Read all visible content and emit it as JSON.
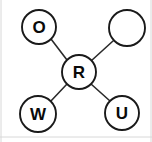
{
  "diagram": {
    "type": "node-link-diagram",
    "canvas": {
      "width": 152,
      "height": 142,
      "background": "#ffffff"
    },
    "style": {
      "node_fill": "#ffffff",
      "node_stroke": "#1a1a1a",
      "node_stroke_width": 1.9,
      "edge_stroke": "#2b2b2b",
      "edge_stroke_width": 1.6,
      "label_color": "#0a0a0a",
      "frame_color": "#d8d8d8"
    },
    "nodes": [
      {
        "id": "top-left",
        "label": "O",
        "cx": 39,
        "cy": 27,
        "r": 17,
        "empty": false
      },
      {
        "id": "top-right",
        "label": "",
        "cx": 127,
        "cy": 28,
        "r": 18,
        "empty": true
      },
      {
        "id": "center",
        "label": "R",
        "cx": 79,
        "cy": 72,
        "r": 17,
        "empty": false
      },
      {
        "id": "bottom-left",
        "label": "W",
        "cx": 38,
        "cy": 114,
        "r": 18,
        "empty": false
      },
      {
        "id": "bottom-right",
        "label": "U",
        "cx": 122,
        "cy": 113,
        "r": 17,
        "empty": false
      }
    ],
    "edges": [
      {
        "id": "edge-center-top-left",
        "from": "center",
        "to": "top-left",
        "x1": 67,
        "y1": 60,
        "x2": 51,
        "y2": 39
      },
      {
        "id": "edge-center-top-right",
        "from": "center",
        "to": "top-right",
        "x1": 91,
        "y1": 61,
        "x2": 113,
        "y2": 41
      },
      {
        "id": "edge-center-bottom-left",
        "from": "center",
        "to": "bottom-left",
        "x1": 67,
        "y1": 84,
        "x2": 50,
        "y2": 102
      },
      {
        "id": "edge-center-bottom-right",
        "from": "center",
        "to": "bottom-right",
        "x1": 91,
        "y1": 84,
        "x2": 110,
        "y2": 101
      }
    ],
    "frame": {
      "left_line": {
        "x1": 1,
        "y1": 0,
        "x2": 1,
        "y2": 142
      },
      "bottom_line": {
        "x1": 0,
        "y1": 137,
        "x2": 152,
        "y2": 137
      },
      "right_line": {
        "x1": 151,
        "y1": 0,
        "x2": 151,
        "y2": 142
      }
    }
  }
}
